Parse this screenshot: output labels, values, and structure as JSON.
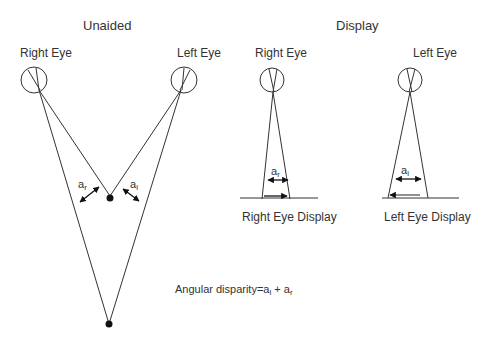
{
  "unaided": {
    "title": "Unaided",
    "right_eye_label": "Right Eye",
    "left_eye_label": "Left Eye",
    "angle_right": {
      "base": "a",
      "sub": "r"
    },
    "angle_left": {
      "base": "a",
      "sub": "l"
    }
  },
  "display": {
    "title": "Display",
    "right_eye_label": "Right Eye",
    "left_eye_label": "Left Eye",
    "right_display_label": "Right Eye Display",
    "left_display_label": "Left Eye Display",
    "angle_right": {
      "base": "a",
      "sub": "r"
    },
    "angle_left": {
      "base": "a",
      "sub": "l"
    }
  },
  "formula": {
    "prefix": "Angular disparity=a",
    "sub1": "l",
    "mid": " + a",
    "sub2": "r"
  }
}
